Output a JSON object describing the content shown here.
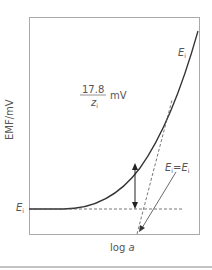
{
  "diagram": {
    "y_axis_label": "EMF/mV",
    "x_axis_label_prefix": "log ",
    "x_axis_label_var": "a",
    "curve_label": {
      "var": "E",
      "sub": "i"
    },
    "baseline_label": {
      "var": "E",
      "sub": "i"
    },
    "slope_fraction": {
      "numerator": "17.8",
      "denominator_var": "z",
      "denominator_sub": "i",
      "unit": "mV"
    },
    "intersection_label": {
      "left_var": "E",
      "left_sub": "i",
      "eq": "=",
      "right_var": "E",
      "right_sub": "i"
    }
  }
}
